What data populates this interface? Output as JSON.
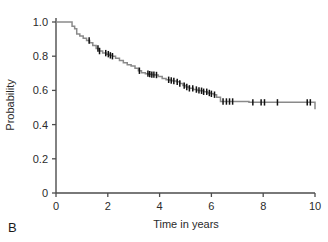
{
  "figure": {
    "panel_label": "B",
    "background_color": "#ffffff"
  },
  "chart_data": {
    "type": "line",
    "subtype": "kaplan-meier-step",
    "title": "",
    "subtitle": "",
    "xlabel": "Time in years",
    "ylabel": "Probability",
    "xlim": [
      0,
      10
    ],
    "ylim": [
      0,
      1.0
    ],
    "xticks": [
      0,
      2,
      4,
      6,
      8,
      10
    ],
    "xtick_labels": [
      "0",
      "2",
      "4",
      "6",
      "8",
      "10"
    ],
    "yticks": [
      0,
      0.2,
      0.4,
      0.6,
      0.8,
      1.0
    ],
    "ytick_labels": [
      "0",
      "0.2",
      "0.4",
      "0.6",
      "0.8",
      "1.0"
    ],
    "grid": false,
    "legend": false,
    "legend_position": "none",
    "curve_color": "#8a8a8a",
    "censor_color": "#111111",
    "axis_color": "#4d4d4d",
    "series": [
      {
        "name": "Survival probability",
        "x": [
          0.0,
          0.55,
          0.62,
          0.72,
          0.8,
          0.92,
          1.05,
          1.18,
          1.3,
          1.42,
          1.55,
          1.68,
          1.8,
          1.95,
          2.05,
          2.18,
          2.3,
          2.45,
          2.6,
          2.75,
          2.9,
          3.05,
          3.18,
          3.3,
          3.45,
          3.58,
          3.7,
          3.82,
          3.95,
          4.1,
          4.25,
          4.4,
          4.52,
          4.65,
          4.78,
          4.9,
          5.02,
          5.15,
          5.3,
          5.45,
          5.58,
          5.7,
          5.85,
          6.0,
          6.1,
          6.2,
          6.35,
          7.45,
          10.0
        ],
        "y": [
          1.0,
          1.0,
          0.975,
          0.96,
          0.93,
          0.918,
          0.905,
          0.892,
          0.878,
          0.862,
          0.845,
          0.83,
          0.818,
          0.812,
          0.805,
          0.8,
          0.788,
          0.775,
          0.762,
          0.75,
          0.742,
          0.73,
          0.715,
          0.703,
          0.698,
          0.695,
          0.692,
          0.69,
          0.682,
          0.67,
          0.662,
          0.658,
          0.655,
          0.65,
          0.64,
          0.628,
          0.62,
          0.612,
          0.605,
          0.6,
          0.598,
          0.592,
          0.585,
          0.58,
          0.575,
          0.56,
          0.535,
          0.53,
          0.49
        ]
      }
    ],
    "censor_marks_x": [
      1.28,
      1.62,
      1.68,
      1.92,
      2.02,
      2.1,
      2.18,
      3.22,
      3.55,
      3.62,
      3.7,
      3.78,
      3.88,
      4.35,
      4.45,
      4.55,
      4.68,
      4.78,
      4.95,
      5.05,
      5.15,
      5.28,
      5.42,
      5.52,
      5.62,
      5.7,
      5.82,
      5.92,
      6.0,
      6.12,
      6.45,
      6.58,
      6.7,
      6.82,
      7.6,
      7.92,
      8.05,
      8.55,
      9.7,
      9.82
    ]
  }
}
